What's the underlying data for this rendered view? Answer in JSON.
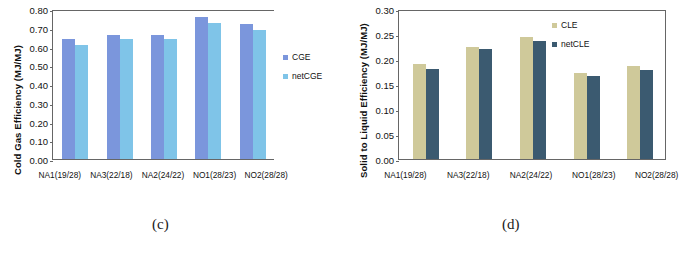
{
  "figure": {
    "panels": [
      {
        "caption": "(c)",
        "ylabel": "Cold Gas Efficiency (MJ/MJ)",
        "yticks": [
          "0.00",
          "0.10",
          "0.20",
          "0.30",
          "0.40",
          "0.50",
          "0.60",
          "0.70",
          "0.80"
        ],
        "legend": [
          {
            "label": "CGE",
            "color": "#7B96DC"
          },
          {
            "label": "netCGE",
            "color": "#7FC4E8"
          }
        ]
      },
      {
        "caption": "(d)",
        "ylabel": "Solid to Liquid Efficiency (MJ/MJ)",
        "yticks": [
          "0.00",
          "0.05",
          "0.10",
          "0.15",
          "0.20",
          "0.25",
          "0.30"
        ],
        "legend": [
          {
            "label": "CLE",
            "color": "#CFC99A"
          },
          {
            "label": "netCLE",
            "color": "#3B5A70"
          }
        ]
      }
    ]
  },
  "chart_data": [
    {
      "type": "bar",
      "title": "(c)",
      "xlabel": "",
      "ylabel": "Cold Gas Efficiency (MJ/MJ)",
      "ylim": [
        0.0,
        0.8
      ],
      "ytick_step": 0.1,
      "grid": false,
      "legend_position": "right",
      "categories": [
        "NA1(19/28)",
        "NA3(22/18)",
        "NA2(24/22)",
        "NO1(28/23)",
        "NO2(28/28)"
      ],
      "series": [
        {
          "name": "CGE",
          "color": "#7B96DC",
          "values": [
            0.64,
            0.66,
            0.66,
            0.755,
            0.72
          ]
        },
        {
          "name": "netCGE",
          "color": "#7FC4E8",
          "values": [
            0.61,
            0.64,
            0.64,
            0.725,
            0.69
          ]
        }
      ]
    },
    {
      "type": "bar",
      "title": "(d)",
      "xlabel": "",
      "ylabel": "Solid to Liquid Efficiency (MJ/MJ)",
      "ylim": [
        0.0,
        0.3
      ],
      "ytick_step": 0.05,
      "grid": false,
      "legend_position": "top-right",
      "categories": [
        "NA1(19/28)",
        "NA3(22/18)",
        "NA2(24/22)",
        "NO1(28/23)",
        "NO2(28/28)"
      ],
      "series": [
        {
          "name": "CLE",
          "color": "#CFC99A",
          "values": [
            0.19,
            0.225,
            0.245,
            0.172,
            0.187
          ]
        },
        {
          "name": "netCLE",
          "color": "#3B5A70",
          "values": [
            0.181,
            0.22,
            0.237,
            0.166,
            0.179
          ]
        }
      ]
    }
  ]
}
